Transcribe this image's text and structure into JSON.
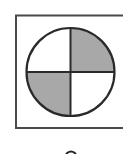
{
  "figure": {
    "type": "quadrant-circle-diagram",
    "frame": {
      "stroke": "#4a4a4a",
      "fill": "#ffffff",
      "cropped_right": true
    },
    "circle": {
      "stroke": "#2a2a2a",
      "quadrants": [
        {
          "position": "top-left",
          "shaded": false,
          "fill": "#ffffff"
        },
        {
          "position": "top-right",
          "shaded": true,
          "fill": "#a8a8a8"
        },
        {
          "position": "bottom-left",
          "shaded": true,
          "fill": "#a8a8a8"
        },
        {
          "position": "bottom-right",
          "shaded": false,
          "fill": "#ffffff"
        }
      ]
    },
    "label": {
      "text": "",
      "cropped": true
    }
  }
}
